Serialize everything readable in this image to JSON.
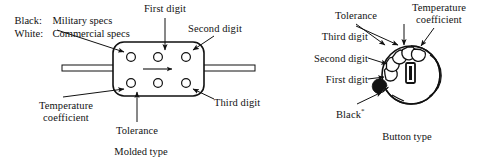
{
  "figure": {
    "background_color": "#ffffff",
    "ink_color": "#111111"
  },
  "legend": {
    "rows": [
      {
        "key": "Black:",
        "value": "Military specs",
        "swatch": "black"
      },
      {
        "key": "White:",
        "value": "Commercial specs",
        "swatch": "white"
      }
    ]
  },
  "molded": {
    "caption": "Molded type",
    "labels": {
      "first_digit": "First digit",
      "second_digit": "Second digit",
      "third_digit": "Third digit",
      "tolerance": "Tolerance",
      "temperature_coefficient_line1": "Temperature",
      "temperature_coefficient_line2": "coefficient"
    },
    "body": {
      "shape": "rounded-rectangle",
      "dot_count": 6,
      "dot_rows": 2,
      "dot_columns": 3,
      "lead_count": 2,
      "direction_arrow": "right"
    }
  },
  "button": {
    "caption": "Button type",
    "labels": {
      "first_digit": "First digit",
      "second_digit": "Second digit",
      "third_digit": "Third digit",
      "tolerance": "Tolerance",
      "black": "Black",
      "black_superscript": "*",
      "temperature_coefficient_line1": "Temperature",
      "temperature_coefficient_line2": "coefficient"
    },
    "body": {
      "shape": "circle-with-notches",
      "notch_count": 6,
      "filled_notch_count": 1,
      "center_slot": "rectangular-slot"
    }
  }
}
